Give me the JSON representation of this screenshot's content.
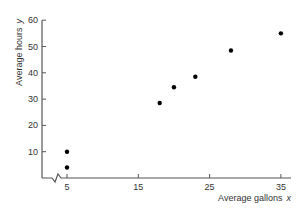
{
  "chart_data": {
    "type": "scatter",
    "title": "",
    "xlabel": "Average gallons",
    "xvar": "x",
    "ylabel": "Average hours",
    "yvar": "y",
    "x_ticks": [
      5,
      15,
      25,
      35
    ],
    "y_ticks": [
      10,
      20,
      30,
      40,
      50,
      60
    ],
    "xlim": [
      0,
      36
    ],
    "ylim": [
      0,
      60
    ],
    "x_axis_break": true,
    "grid": false,
    "legend": null,
    "points": [
      {
        "x": 5,
        "y": 4
      },
      {
        "x": 5,
        "y": 10
      },
      {
        "x": 18,
        "y": 28.5
      },
      {
        "x": 20,
        "y": 34.5
      },
      {
        "x": 23,
        "y": 38.5
      },
      {
        "x": 28,
        "y": 48.5
      },
      {
        "x": 35,
        "y": 55
      }
    ]
  },
  "colors": {
    "axis": "#555555",
    "point": "#000000",
    "text": "#333333"
  }
}
